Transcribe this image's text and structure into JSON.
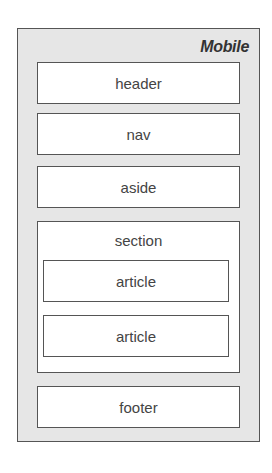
{
  "diagram": {
    "title": "Mobile",
    "blocks": [
      {
        "label": "header"
      },
      {
        "label": "nav"
      },
      {
        "label": "aside"
      },
      {
        "label": "section",
        "children": [
          {
            "label": "article"
          },
          {
            "label": "article"
          }
        ]
      },
      {
        "label": "footer"
      }
    ]
  },
  "colors": {
    "background": "#ffffff",
    "frame_fill": "#e6e6e6",
    "box_fill": "#ffffff",
    "border": "#555555",
    "text": "#444444"
  }
}
